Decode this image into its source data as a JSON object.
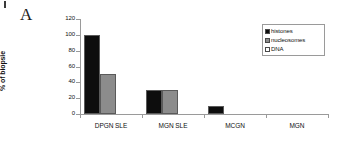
{
  "panel": {
    "label": "A"
  },
  "chart_data": {
    "type": "bar",
    "title": "",
    "xlabel": "",
    "ylabel": "% of biopsie",
    "ylim": [
      0,
      120
    ],
    "yticks": [
      "0",
      "20",
      "40",
      "60",
      "80",
      "100",
      "120"
    ],
    "grid": false,
    "legend_position": "top-right",
    "categories": [
      "DPGN SLE",
      "MGN SLE",
      "MCGN",
      "MGN"
    ],
    "series": [
      {
        "name": "histones",
        "color": "#0d0d0d",
        "values": [
          100,
          30,
          10,
          0
        ]
      },
      {
        "name": "nucleosomes",
        "color": "#8c8c8c",
        "values": [
          50,
          30,
          0,
          0
        ]
      },
      {
        "name": "DNA",
        "color": "#ffffff",
        "values": [
          0,
          0,
          0,
          0
        ]
      }
    ]
  },
  "legend": {
    "items": [
      {
        "label": "histones",
        "swatch": "black-square-icon"
      },
      {
        "label": "nucleosomes",
        "swatch": "gray-square-icon"
      },
      {
        "label": "DNA",
        "swatch": "white-square-icon"
      }
    ]
  }
}
